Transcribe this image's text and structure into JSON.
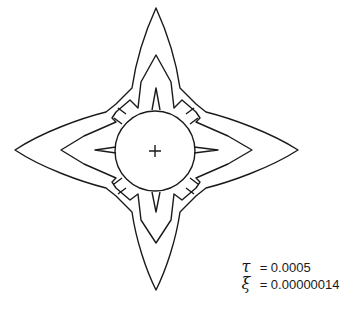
{
  "figure": {
    "center_marker": "crosshair",
    "line_color": "#1a1a1a",
    "background": "#ffffff"
  },
  "params": [
    {
      "symbol": "τ",
      "equals": "=",
      "value": "0.0005"
    },
    {
      "symbol": "ξ",
      "equals": "=",
      "value": "0.00000014"
    }
  ]
}
